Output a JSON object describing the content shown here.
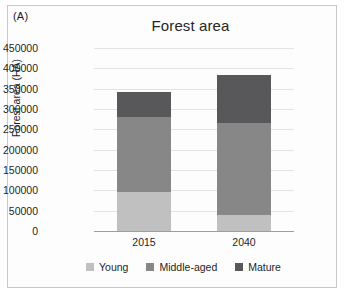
{
  "panel": {
    "label": "(A)"
  },
  "colors": {
    "young": "#c0c0c0",
    "middle_aged": "#878787",
    "mature": "#58585a",
    "gridline": "#e3e3e3",
    "axis": "#9e9e9e",
    "text": "#1f1f1f",
    "border": "#c8c8c8",
    "background": "#fdfdfd"
  },
  "chart_data": {
    "type": "bar",
    "subtype": "stacked-column",
    "title": "Forest area",
    "subtitle": "",
    "xlabel": "",
    "ylabel": "Forest area (HA)",
    "categories": [
      "2015",
      "2040"
    ],
    "series": [
      {
        "name": "Young",
        "color": "#c0c0c0",
        "values": [
          95000,
          40000
        ]
      },
      {
        "name": "Middle-aged",
        "color": "#878787",
        "values": [
          185000,
          225000
        ]
      },
      {
        "name": "Mature",
        "color": "#58585a",
        "values": [
          62000,
          118000
        ]
      }
    ],
    "totals": [
      342000,
      383000
    ],
    "ylim": [
      0,
      450000
    ],
    "ytick_step": 50000,
    "yticks": [
      "450000",
      "400000",
      "350000",
      "300000",
      "250000",
      "200000",
      "150000",
      "100000",
      "50000",
      "0"
    ],
    "grid": true,
    "legend_position": "bottom"
  }
}
